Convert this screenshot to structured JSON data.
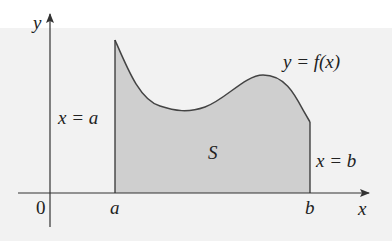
{
  "diagram": {
    "axes": {
      "x_label": "x",
      "y_label": "y",
      "origin_label": "0"
    },
    "curve_label": "y = f(x)",
    "region_label": "S",
    "left_bound_label": "x = a",
    "right_bound_label": "x = b",
    "tick_a": "a",
    "tick_b": "b",
    "colors": {
      "fill": "#cfcfcf",
      "stroke": "#444444",
      "panel": "#f2f2f2",
      "background": "#ffffff"
    }
  }
}
